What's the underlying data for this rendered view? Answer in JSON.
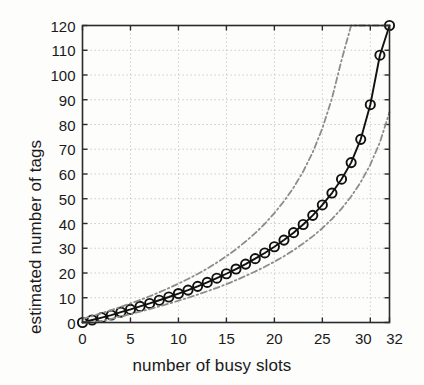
{
  "figure": {
    "background_color": "#fdfdfc",
    "axes_color": "#2b2b2b",
    "grid_color": "#c9c9c9",
    "main_series_color": "#111111",
    "bound_series_color": "#8c8c8c"
  },
  "chart_data": {
    "type": "line",
    "title": "",
    "xlabel": "number of busy slots",
    "ylabel": "estimated number of tags",
    "xlim": [
      0,
      32
    ],
    "ylim": [
      0,
      120
    ],
    "xticks": [
      0,
      5,
      10,
      15,
      20,
      25,
      30,
      32
    ],
    "xticklabels": [
      "0",
      "5",
      "10",
      "15",
      "20",
      "25",
      "30",
      "32"
    ],
    "yticks": [
      0,
      10,
      20,
      30,
      40,
      50,
      60,
      70,
      80,
      90,
      100,
      110,
      120
    ],
    "yticklabels": [
      "0",
      "10",
      "20",
      "30",
      "40",
      "50",
      "60",
      "70",
      "80",
      "90",
      "100",
      "110",
      "120"
    ],
    "grid": true,
    "grid_style": "dotted",
    "legend": "none",
    "x": [
      0,
      1,
      2,
      3,
      4,
      5,
      6,
      7,
      8,
      9,
      10,
      11,
      12,
      13,
      14,
      15,
      16,
      17,
      18,
      19,
      20,
      21,
      22,
      23,
      24,
      25,
      26,
      27,
      28,
      29,
      30,
      31,
      32
    ],
    "series": [
      {
        "name": "estimate",
        "style": "solid",
        "marker": "circle-open",
        "color": "#111111",
        "values": [
          0,
          1,
          2,
          3,
          4.2,
          5.3,
          6.5,
          7.7,
          9,
          10.3,
          11.7,
          13.1,
          14.6,
          16.2,
          17.9,
          19.7,
          21.6,
          23.6,
          25.8,
          28.1,
          30.6,
          33.3,
          36.3,
          39.6,
          43.3,
          47.5,
          52.3,
          57.9,
          64.6,
          74,
          88,
          108,
          120
        ]
      },
      {
        "name": "upper-bound",
        "style": "dash-dot",
        "marker": "none",
        "color": "#8c8c8c",
        "values": [
          1.5,
          2.6,
          3.8,
          5,
          6.3,
          7.7,
          9.1,
          10.6,
          12.2,
          13.9,
          15.7,
          17.6,
          19.6,
          21.8,
          24.2,
          26.8,
          29.6,
          32.7,
          36.1,
          39.9,
          44.2,
          49,
          54.5,
          61,
          68.8,
          78.4,
          90.5,
          106,
          120,
          120,
          120,
          120,
          120
        ]
      },
      {
        "name": "lower-bound",
        "style": "dash-dot",
        "marker": "none",
        "color": "#8c8c8c",
        "values": [
          0,
          0,
          0.6,
          1.5,
          2.4,
          3.4,
          4.4,
          5.4,
          6.5,
          7.6,
          8.8,
          10,
          11.3,
          12.6,
          14,
          15.5,
          17.1,
          18.8,
          20.6,
          22.5,
          24.6,
          26.8,
          29.2,
          31.9,
          34.8,
          38.1,
          41.8,
          46,
          50.9,
          56.7,
          63.8,
          72.8,
          85
        ]
      }
    ]
  }
}
